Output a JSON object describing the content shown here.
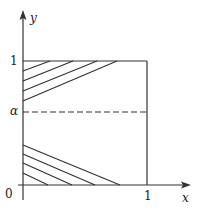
{
  "figure": {
    "type": "region-diagram",
    "axes": {
      "x_label": "x",
      "y_label": "y",
      "origin_label": "0",
      "x_tick_labels": [
        "1"
      ],
      "y_tick_labels": [
        "1",
        "α"
      ]
    },
    "unit_square": {
      "x": [
        0,
        1
      ],
      "y": [
        0,
        1
      ]
    },
    "dashed_line": {
      "label": "α",
      "orientation": "horizontal"
    },
    "shaded_regions": [
      {
        "name": "upper-left-triangle",
        "description": "hatched region near top-left corner, bounded by y=1 and x=0"
      },
      {
        "name": "lower-left-triangle",
        "description": "hatched region near origin, bounded by x=0 and y=0"
      }
    ],
    "colors": {
      "ink": "#333333",
      "background": "#ffffff"
    }
  },
  "labels": {
    "y_axis": "y",
    "x_axis": "x",
    "origin": "0",
    "y_one": "1",
    "x_one": "1",
    "alpha": "α"
  }
}
